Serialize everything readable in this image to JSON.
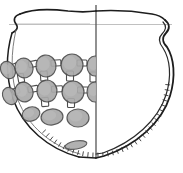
{
  "figure": {
    "view": "half-elevation and half-section",
    "caption": "",
    "background_color": "#ffffff",
    "ink_color": "#1a1a1a",
    "boss_fill_color": "#a9a9a9",
    "boss_stroke_color": "#4d4d4d",
    "hatch_color": "#2b2b2b",
    "faint_line_color": "#b5b5b5"
  },
  "axes": {
    "center_line": {
      "name": "vertical-centre-axis",
      "x": 96,
      "y_top": 6,
      "y_bottom": 158
    },
    "rim_guide_line": {
      "name": "rim-level-guide",
      "y": 24,
      "x_left": 9,
      "x_right": 172
    }
  },
  "outline": {
    "left_profile_label": "exterior elevation (decorated half)",
    "right_profile_label": "sectioned half with wall thickness",
    "rim_form": "everted S-profile rim",
    "base_form": "rounded sagging base"
  },
  "decoration": {
    "name": "applied boss and bar lattice",
    "description": "three staggered rows of circular applied bosses linked by short rectangular bars",
    "row_count": 3,
    "bar_count": 14,
    "rows": [
      {
        "name": "upper-boss-row",
        "y_nominal": 66,
        "bosses": [
          {
            "cx": 8,
            "cy": 70,
            "rx": 7,
            "ry": 9,
            "rot": -28
          },
          {
            "cx": 24,
            "cy": 68,
            "rx": 9,
            "ry": 10,
            "rot": -18
          },
          {
            "cx": 46,
            "cy": 66,
            "rx": 10,
            "ry": 11,
            "rot": -8
          },
          {
            "cx": 72,
            "cy": 65,
            "rx": 11,
            "ry": 11,
            "rot": 0
          },
          {
            "cx": 95,
            "cy": 66,
            "rx": 8,
            "ry": 10,
            "rot": 0
          }
        ]
      },
      {
        "name": "middle-boss-row",
        "y_nominal": 92,
        "bosses": [
          {
            "cx": 10,
            "cy": 96,
            "rx": 7,
            "ry": 9,
            "rot": -30
          },
          {
            "cx": 24,
            "cy": 92,
            "rx": 9,
            "ry": 10,
            "rot": -20
          },
          {
            "cx": 47,
            "cy": 91,
            "rx": 10,
            "ry": 11,
            "rot": -6
          },
          {
            "cx": 73,
            "cy": 92,
            "rx": 11,
            "ry": 11,
            "rot": 0
          },
          {
            "cx": 95,
            "cy": 92,
            "rx": 8,
            "ry": 10,
            "rot": 0
          }
        ]
      },
      {
        "name": "lower-boss-row",
        "y_nominal": 116,
        "bosses": [
          {
            "cx": 31,
            "cy": 114,
            "rx": 9,
            "ry": 7,
            "rot": -18
          },
          {
            "cx": 52,
            "cy": 117,
            "rx": 11,
            "ry": 8,
            "rot": -6
          },
          {
            "cx": 78,
            "cy": 118,
            "rx": 11,
            "ry": 9,
            "rot": 0
          }
        ]
      }
    ],
    "connector_bars": [
      {
        "x": 15,
        "y": 66,
        "w": 6,
        "h": 5,
        "rot": -25
      },
      {
        "x": 33,
        "y": 64,
        "w": 9,
        "h": 6,
        "rot": -12
      },
      {
        "x": 56,
        "y": 63,
        "w": 10,
        "h": 6,
        "rot": -4
      },
      {
        "x": 82,
        "y": 63,
        "w": 10,
        "h": 6,
        "rot": 0
      },
      {
        "x": 16,
        "y": 91,
        "w": 7,
        "h": 6,
        "rot": -22
      },
      {
        "x": 33,
        "y": 89,
        "w": 10,
        "h": 6,
        "rot": -10
      },
      {
        "x": 57,
        "y": 89,
        "w": 11,
        "h": 6,
        "rot": -3
      },
      {
        "x": 83,
        "y": 90,
        "w": 11,
        "h": 6,
        "rot": 0
      },
      {
        "x": 21,
        "y": 78,
        "w": 6,
        "h": 9,
        "rot": -10
      },
      {
        "x": 44,
        "y": 76,
        "w": 7,
        "h": 10,
        "rot": -4
      },
      {
        "x": 70,
        "y": 76,
        "w": 7,
        "h": 10,
        "rot": 0
      },
      {
        "x": 93,
        "y": 77,
        "w": 6,
        "h": 10,
        "rot": 0
      },
      {
        "x": 45,
        "y": 102,
        "w": 7,
        "h": 9,
        "rot": -4
      },
      {
        "x": 71,
        "y": 103,
        "w": 7,
        "h": 9,
        "rot": 0
      }
    ],
    "isolated_boss": {
      "name": "lower-isolated-boss",
      "cx": 76,
      "cy": 145,
      "rx": 11,
      "ry": 4,
      "rot": -10
    }
  },
  "section_hatching": {
    "name": "wall-section-hatch",
    "description": "short oblique tick marks along the sectioned wall indicating fabric thickness",
    "tick_count": 40,
    "visible_from_angle_deg": 95,
    "visible_to_angle_deg": 250
  }
}
